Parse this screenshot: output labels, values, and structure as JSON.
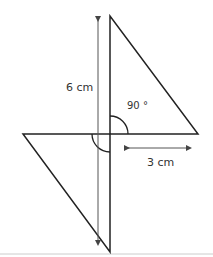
{
  "diagram": {
    "labels": {
      "height": "6 cm",
      "angle": "90 °",
      "base": "3 cm"
    },
    "colors": {
      "line": "#222222",
      "arrow": "#555555",
      "baseline": "#cccccc",
      "text": "#333333"
    }
  }
}
